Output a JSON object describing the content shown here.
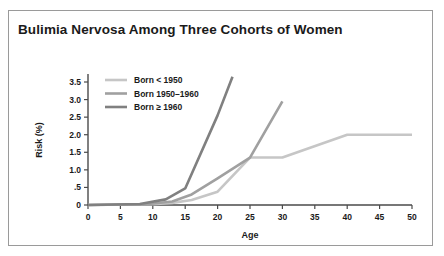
{
  "figure": {
    "title": "Bulimia Nervosa  Among Three Cohorts of  Women"
  },
  "chart_data": {
    "type": "line",
    "title": "Bulimia Nervosa  Among Three Cohorts of  Women",
    "xlabel": "Age",
    "ylabel": "Risk (%)",
    "xlim": [
      0,
      50
    ],
    "ylim": [
      0,
      3.75
    ],
    "grid": false,
    "legend_position": "upper-left-inside",
    "xticks": [
      0,
      5,
      10,
      15,
      20,
      25,
      30,
      35,
      40,
      45,
      50
    ],
    "xticklabels": [
      "0",
      "5",
      "10",
      "15",
      "20",
      "25",
      "30",
      "35",
      "40",
      "45",
      "50"
    ],
    "yticks": [
      0,
      0.5,
      1.0,
      1.5,
      2.0,
      2.5,
      3.0,
      3.5
    ],
    "yticklabels": [
      "0",
      ".5",
      "1.0",
      "1.5",
      "2.0",
      "2.5",
      "3.0",
      "3.5"
    ],
    "series": [
      {
        "name": "Born < 1950",
        "color": "#c6c6c6",
        "points": [
          [
            0,
            0.0
          ],
          [
            10,
            0.02
          ],
          [
            13,
            0.06
          ],
          [
            16,
            0.14
          ],
          [
            20,
            0.38
          ],
          [
            25,
            1.35
          ],
          [
            30,
            1.35
          ],
          [
            40,
            2.0
          ],
          [
            50,
            2.0
          ]
        ]
      },
      {
        "name": "Born 1950–1960",
        "color": "#a0a0a0",
        "points": [
          [
            0,
            0.0
          ],
          [
            9,
            0.02
          ],
          [
            13,
            0.1
          ],
          [
            16,
            0.3
          ],
          [
            20,
            0.76
          ],
          [
            25,
            1.35
          ],
          [
            30,
            2.95
          ]
        ]
      },
      {
        "name": "Born ≥ 1960",
        "color": "#808080",
        "points": [
          [
            0,
            0.0
          ],
          [
            8,
            0.03
          ],
          [
            12,
            0.16
          ],
          [
            15,
            0.47
          ],
          [
            20,
            2.55
          ],
          [
            22.3,
            3.65
          ]
        ]
      }
    ]
  },
  "legend": {
    "entries": [
      {
        "label": "Born < 1950"
      },
      {
        "label": "Born 1950–1960"
      },
      {
        "label": "Born ≥ 1960"
      }
    ]
  }
}
